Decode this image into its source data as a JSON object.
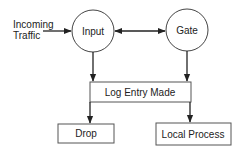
{
  "diagram": {
    "source_label_line1": "Incoming",
    "source_label_line2": "Traffic",
    "nodes": {
      "input": {
        "label": "Input",
        "shape": "circle"
      },
      "gate": {
        "label": "Gate",
        "shape": "circle"
      },
      "log": {
        "label": "Log Entry Made",
        "shape": "box"
      },
      "drop": {
        "label": "Drop",
        "shape": "box"
      },
      "local": {
        "label": "Local Process",
        "shape": "box"
      }
    },
    "edges": [
      {
        "from": "Incoming Traffic",
        "to": "Input"
      },
      {
        "from": "Input",
        "to": "Gate",
        "bidirectional": true
      },
      {
        "from": "Input",
        "to": "Log Entry Made"
      },
      {
        "from": "Gate",
        "to": "Log Entry Made"
      },
      {
        "from": "Log Entry Made",
        "to": "Drop"
      },
      {
        "from": "Log Entry Made",
        "to": "Local Process"
      }
    ],
    "colors": {
      "stroke": "#333333",
      "background": "#ffffff"
    }
  }
}
